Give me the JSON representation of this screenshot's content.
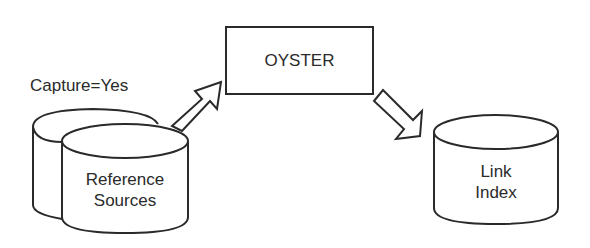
{
  "diagram": {
    "capture_label": "Capture=Yes",
    "reference_sources": {
      "line1": "Reference",
      "line2": "Sources"
    },
    "process_box": {
      "label": "OYSTER"
    },
    "link_index": {
      "line1": "Link",
      "line2": "Index"
    }
  },
  "colors": {
    "stroke": "#2a2a2a",
    "fill": "#ffffff"
  }
}
